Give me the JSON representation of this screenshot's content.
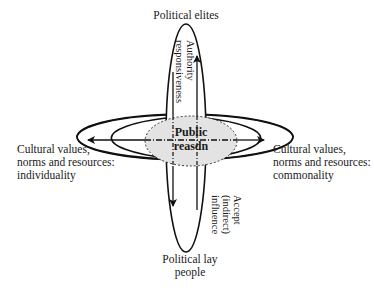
{
  "diagram": {
    "nodes": {
      "top": {
        "label": "Political elites"
      },
      "bottom": {
        "line1": "Political lay",
        "line2": "people"
      },
      "left": {
        "line1": "Cultural values,",
        "line2": "norms and resources:",
        "line3": "individuality"
      },
      "right": {
        "line1": "Cultural values,",
        "line2": "norms and resources:",
        "line3": "commonality"
      },
      "center": {
        "line1": "Public",
        "line2": "reasdn"
      }
    },
    "arrows": {
      "upward": {
        "line1": "Authority",
        "line2": "responsiveness"
      },
      "downward": {
        "line1": "Accept",
        "line2": "(indirect)",
        "line3": "influence"
      }
    },
    "colors": {
      "stroke": "#111111",
      "center_fill": "#e3e3e3"
    }
  }
}
